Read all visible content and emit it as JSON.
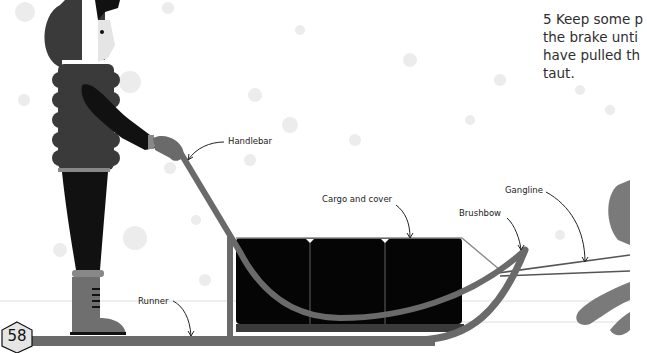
{
  "page": {
    "number": "58",
    "instruction": {
      "step": "5",
      "lines": [
        "5 Keep some p",
        "the brake unti",
        "have pulled th",
        "taut."
      ]
    }
  },
  "labels": {
    "handlebar": "Handlebar",
    "cargo": "Cargo and cover",
    "brushbow": "Brushbow",
    "gangline": "Gangline",
    "runner": "Runner"
  },
  "colors": {
    "background": "#ffffff",
    "jacket": "#3a3a3a",
    "pants": "#111111",
    "sled": "#6a6a6a",
    "cargo": "#050505",
    "boot": "#6f6f6f",
    "dog": "#7a7a7a",
    "snow": "#e9e9e9"
  }
}
